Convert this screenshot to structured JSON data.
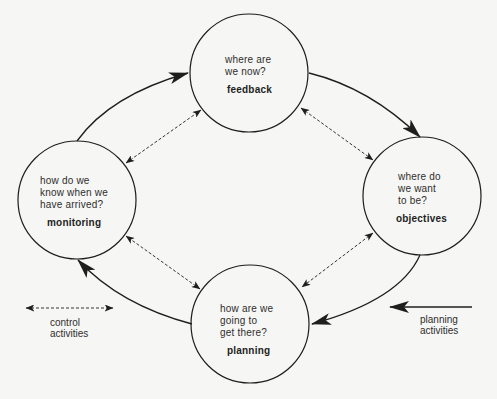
{
  "colors": {
    "background": "#f6f6f4",
    "stroke": "#1e1e1e"
  },
  "nodes": {
    "feedback": {
      "question": "where are\nwe now?",
      "label": "feedback"
    },
    "objectives": {
      "question": "where do\nwe want\nto be?",
      "label": "objectives"
    },
    "planning": {
      "question": "how are we\ngoing to\nget there?",
      "label": "planning"
    },
    "monitoring": {
      "question": "how do we\nknow when we\nhave arrived?",
      "label": "monitoring"
    }
  },
  "legend": {
    "control": {
      "icon": "dashed-double-arrow-icon",
      "text": "control\nactivities"
    },
    "planning": {
      "icon": "solid-left-arrow-icon",
      "text": "planning\nactivities"
    }
  },
  "edges": {
    "planning_cycle": [
      {
        "from": "monitoring",
        "to": "feedback",
        "style": "solid"
      },
      {
        "from": "feedback",
        "to": "objectives",
        "style": "solid"
      },
      {
        "from": "objectives",
        "to": "planning",
        "style": "solid"
      },
      {
        "from": "planning",
        "to": "monitoring",
        "style": "solid"
      }
    ],
    "control_links": [
      {
        "between": [
          "monitoring",
          "feedback"
        ],
        "style": "dashed-bidirectional"
      },
      {
        "between": [
          "feedback",
          "objectives"
        ],
        "style": "dashed-bidirectional"
      },
      {
        "between": [
          "objectives",
          "planning"
        ],
        "style": "dashed-bidirectional"
      },
      {
        "between": [
          "planning",
          "monitoring"
        ],
        "style": "dashed-bidirectional"
      }
    ]
  }
}
